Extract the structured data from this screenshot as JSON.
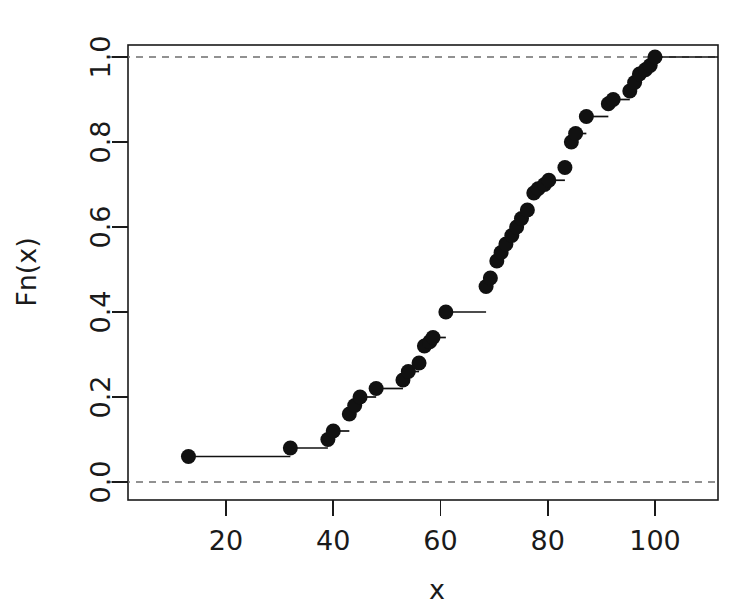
{
  "figure": {
    "background": "#ffffff",
    "width": 744,
    "height": 614
  },
  "chart_data": {
    "type": "line",
    "subtype": "ecdf-step",
    "title": "",
    "subtitle": "",
    "xlabel": "x",
    "ylabel": "Fn(x)",
    "xlim": [
      7,
      113
    ],
    "ylim": [
      -0.04,
      1.04
    ],
    "xticks": [
      20,
      40,
      60,
      80,
      100
    ],
    "xticklabels": [
      "20",
      "40",
      "60",
      "80",
      "100"
    ],
    "yticks": [
      0.0,
      0.2,
      0.4,
      0.6,
      0.8,
      1.0
    ],
    "yticklabels": [
      "0.0",
      "0.2",
      "0.4",
      "0.6",
      "0.8",
      "1.0"
    ],
    "grid": false,
    "legend": null,
    "n_observations": 50,
    "point_color": "#111111",
    "step_color": "#111111",
    "reference_line_color": "#6e6e6e",
    "reference_lines": [
      {
        "y": 0.0,
        "style": "dashed"
      },
      {
        "y": 1.0,
        "style": "dashed"
      }
    ],
    "series": [
      {
        "name": "Fn(x)",
        "x": [
          13,
          32,
          39,
          40,
          43,
          44,
          45,
          48,
          53,
          54,
          56,
          57,
          58,
          58.6,
          61,
          68.5,
          69.3,
          70.5,
          71.3,
          72.2,
          73.3,
          74.2,
          75.1,
          76.2,
          77.4,
          78.2,
          79.4,
          80.2,
          83.2,
          84.4,
          85.2,
          87.2,
          91.3,
          92.2,
          95.3,
          96.2,
          97.1,
          98.2,
          99.1,
          100
        ],
        "y": [
          0.06,
          0.08,
          0.1,
          0.12,
          0.16,
          0.18,
          0.2,
          0.22,
          0.24,
          0.26,
          0.28,
          0.32,
          0.33,
          0.34,
          0.4,
          0.46,
          0.48,
          0.52,
          0.54,
          0.56,
          0.58,
          0.6,
          0.62,
          0.64,
          0.68,
          0.69,
          0.7,
          0.71,
          0.74,
          0.8,
          0.82,
          0.86,
          0.89,
          0.9,
          0.92,
          0.94,
          0.96,
          0.97,
          0.98,
          1.0
        ]
      }
    ]
  },
  "axes": {
    "x_title": "x",
    "y_title": "Fn(x)"
  }
}
